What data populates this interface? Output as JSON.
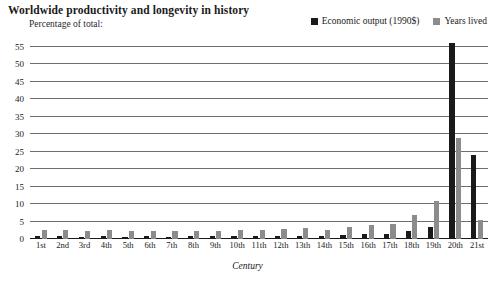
{
  "header": {
    "title": "Worldwide productivity and longevity in history",
    "subtitle": "Percentage of total:"
  },
  "legend": {
    "position": "top-right",
    "entries": [
      {
        "label": "Economic output (1990$)",
        "color": "#1a1a1a",
        "swatch_icon": "square-marker-icon"
      },
      {
        "label": "Years lived",
        "color": "#8c8c8c",
        "swatch_icon": "square-marker-icon"
      }
    ]
  },
  "colors": {
    "economic_output": "#1a1a1a",
    "years_lived": "#8c8c8c",
    "gridline": "#6e6e6e",
    "axis": "#1a1a1a",
    "background": "#ffffff"
  },
  "chart_data": {
    "type": "bar",
    "title": "Worldwide productivity and longevity in history",
    "subtitle": "Percentage of total:",
    "xlabel": "Century",
    "ylabel": "",
    "ylim": [
      0,
      55
    ],
    "yticks": [
      0,
      5,
      10,
      15,
      20,
      25,
      30,
      35,
      40,
      45,
      50,
      55
    ],
    "grid": true,
    "legend_position": "top-right",
    "categories": [
      "1st",
      "2nd",
      "3rd",
      "4th",
      "5th",
      "6th",
      "7th",
      "8th",
      "9th",
      "10th",
      "11th",
      "12th",
      "13th",
      "14th",
      "15th",
      "16th",
      "17th",
      "18th",
      "19th",
      "20th",
      "21st"
    ],
    "series": [
      {
        "name": "Economic output (1990$)",
        "color": "#1a1a1a",
        "values": [
          0.8,
          0.9,
          0.7,
          0.8,
          0.7,
          0.8,
          0.7,
          0.8,
          0.8,
          0.9,
          0.9,
          1.0,
          1.0,
          0.9,
          1.1,
          1.3,
          1.4,
          2.2,
          3.4,
          56.0,
          24.0
        ]
      },
      {
        "name": "Years lived",
        "color": "#8c8c8c",
        "values": [
          2.6,
          2.7,
          2.2,
          2.5,
          2.2,
          2.4,
          2.2,
          2.4,
          2.4,
          2.6,
          2.7,
          3.0,
          3.1,
          2.6,
          3.3,
          3.9,
          4.3,
          7.0,
          11.0,
          29.0,
          5.4
        ]
      }
    ]
  }
}
